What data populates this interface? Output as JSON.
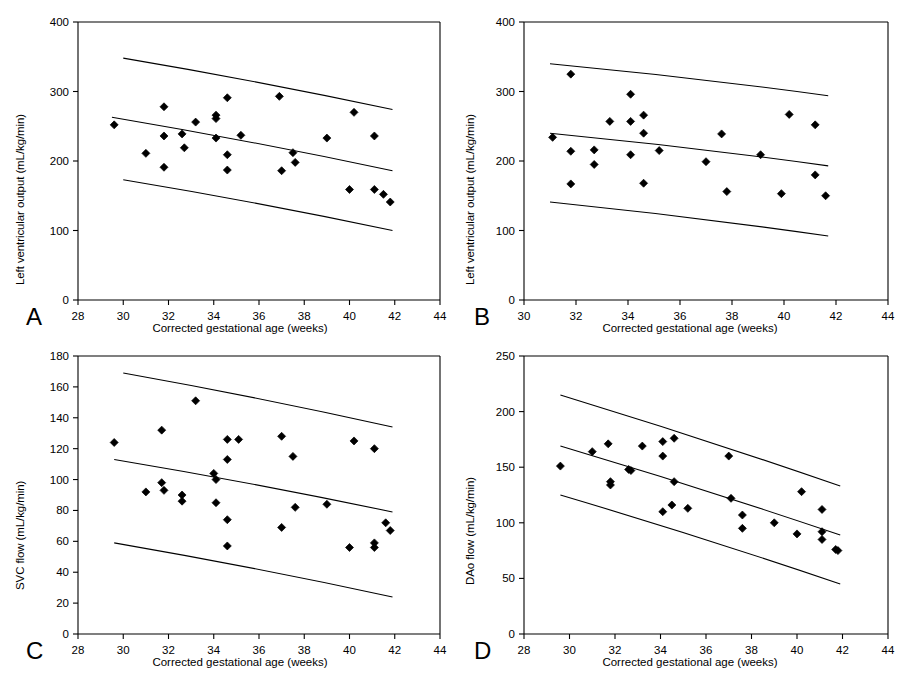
{
  "figure": {
    "title": "",
    "background": "#ffffff",
    "panel_label_color": "#000000",
    "marker_color": "#000000",
    "line_color": "#000000"
  },
  "panels": [
    {
      "id": "A",
      "label": "A",
      "xlabel": "Corrected gestational age (weeks)",
      "ylabel": "Left ventricular output (mL/kg/min)"
    },
    {
      "id": "B",
      "label": "B",
      "xlabel": "Corrected gestational age (weeks)",
      "ylabel": "Left ventricular output (mL/kg/min)"
    },
    {
      "id": "C",
      "label": "C",
      "xlabel": "Corrected gestational age (weeks)",
      "ylabel": "SVC flow (mL/kg/min)"
    },
    {
      "id": "D",
      "label": "D",
      "xlabel": "Corrected gestational age (weeks)",
      "ylabel": "DAo flow (mL/kg/min)"
    }
  ],
  "chart_data": [
    {
      "panel": "A",
      "type": "scatter",
      "title": "",
      "xlabel": "Corrected gestational age (weeks)",
      "ylabel": "Left ventricular output (mL/kg/min)",
      "xlim": [
        28,
        44
      ],
      "ylim": [
        0,
        400
      ],
      "xticks": [
        28,
        30,
        32,
        34,
        36,
        38,
        40,
        42,
        44
      ],
      "yticks": [
        0,
        100,
        200,
        300,
        400
      ],
      "grid": false,
      "legend": "none",
      "points": [
        {
          "x": 29.6,
          "y": 252
        },
        {
          "x": 31.0,
          "y": 211
        },
        {
          "x": 31.8,
          "y": 278
        },
        {
          "x": 31.8,
          "y": 236
        },
        {
          "x": 31.8,
          "y": 191
        },
        {
          "x": 32.6,
          "y": 239
        },
        {
          "x": 32.7,
          "y": 219
        },
        {
          "x": 33.2,
          "y": 256
        },
        {
          "x": 34.1,
          "y": 266
        },
        {
          "x": 34.1,
          "y": 261
        },
        {
          "x": 34.1,
          "y": 233
        },
        {
          "x": 34.6,
          "y": 291
        },
        {
          "x": 34.6,
          "y": 209
        },
        {
          "x": 34.6,
          "y": 187
        },
        {
          "x": 35.2,
          "y": 237
        },
        {
          "x": 36.9,
          "y": 293
        },
        {
          "x": 37.0,
          "y": 186
        },
        {
          "x": 37.5,
          "y": 212
        },
        {
          "x": 37.6,
          "y": 198
        },
        {
          "x": 39.0,
          "y": 233
        },
        {
          "x": 40.0,
          "y": 159
        },
        {
          "x": 40.2,
          "y": 270
        },
        {
          "x": 41.1,
          "y": 236
        },
        {
          "x": 41.1,
          "y": 159
        },
        {
          "x": 41.5,
          "y": 152
        },
        {
          "x": 41.8,
          "y": 141
        }
      ],
      "reference_lines": [
        {
          "name": "upper-limit",
          "x": [
            30.0,
            41.9
          ],
          "y": [
            348,
            274
          ]
        },
        {
          "name": "mean",
          "x": [
            29.5,
            41.9
          ],
          "y": [
            263,
            186
          ]
        },
        {
          "name": "lower-limit",
          "x": [
            30.0,
            41.9
          ],
          "y": [
            173,
            100
          ]
        }
      ]
    },
    {
      "panel": "B",
      "type": "scatter",
      "title": "",
      "xlabel": "Corrected gestational age (weeks)",
      "ylabel": "Left ventricular output (mL/kg/min)",
      "xlim": [
        30,
        44
      ],
      "ylim": [
        0,
        400
      ],
      "xticks": [
        30,
        32,
        34,
        36,
        38,
        40,
        42,
        44
      ],
      "yticks": [
        0,
        100,
        200,
        300,
        400
      ],
      "grid": false,
      "legend": "none",
      "points": [
        {
          "x": 31.1,
          "y": 234
        },
        {
          "x": 31.8,
          "y": 325
        },
        {
          "x": 31.8,
          "y": 214
        },
        {
          "x": 31.8,
          "y": 167
        },
        {
          "x": 32.7,
          "y": 216
        },
        {
          "x": 32.7,
          "y": 195
        },
        {
          "x": 33.3,
          "y": 257
        },
        {
          "x": 34.1,
          "y": 296
        },
        {
          "x": 34.1,
          "y": 257
        },
        {
          "x": 34.1,
          "y": 209
        },
        {
          "x": 34.6,
          "y": 266
        },
        {
          "x": 34.6,
          "y": 240
        },
        {
          "x": 34.6,
          "y": 168
        },
        {
          "x": 35.2,
          "y": 215
        },
        {
          "x": 37.0,
          "y": 199
        },
        {
          "x": 37.6,
          "y": 239
        },
        {
          "x": 37.8,
          "y": 156
        },
        {
          "x": 39.1,
          "y": 209
        },
        {
          "x": 39.9,
          "y": 153
        },
        {
          "x": 40.2,
          "y": 267
        },
        {
          "x": 41.2,
          "y": 252
        },
        {
          "x": 41.2,
          "y": 180
        },
        {
          "x": 41.6,
          "y": 150
        }
      ],
      "reference_lines": [
        {
          "name": "upper-limit",
          "x": [
            31.0,
            41.7
          ],
          "y": [
            340,
            294
          ]
        },
        {
          "name": "mean",
          "x": [
            31.0,
            41.7
          ],
          "y": [
            240,
            193
          ]
        },
        {
          "name": "lower-limit",
          "x": [
            31.0,
            41.7
          ],
          "y": [
            141,
            92
          ]
        }
      ]
    },
    {
      "panel": "C",
      "type": "scatter",
      "title": "",
      "xlabel": "Corrected gestational age (weeks)",
      "ylabel": "SVC flow (mL/kg/min)",
      "xlim": [
        28,
        44
      ],
      "ylim": [
        0,
        180
      ],
      "xticks": [
        28,
        30,
        32,
        34,
        36,
        38,
        40,
        42,
        44
      ],
      "yticks": [
        0,
        20,
        40,
        60,
        80,
        100,
        120,
        140,
        160,
        180
      ],
      "grid": false,
      "legend": "none",
      "points": [
        {
          "x": 29.6,
          "y": 124
        },
        {
          "x": 31.0,
          "y": 92
        },
        {
          "x": 31.7,
          "y": 132
        },
        {
          "x": 31.7,
          "y": 98
        },
        {
          "x": 31.8,
          "y": 93
        },
        {
          "x": 32.6,
          "y": 90
        },
        {
          "x": 32.6,
          "y": 86
        },
        {
          "x": 33.2,
          "y": 151
        },
        {
          "x": 34.0,
          "y": 104
        },
        {
          "x": 34.1,
          "y": 85
        },
        {
          "x": 34.1,
          "y": 100
        },
        {
          "x": 34.6,
          "y": 126
        },
        {
          "x": 34.6,
          "y": 113
        },
        {
          "x": 34.6,
          "y": 74
        },
        {
          "x": 34.6,
          "y": 57
        },
        {
          "x": 35.1,
          "y": 126
        },
        {
          "x": 37.0,
          "y": 128
        },
        {
          "x": 37.0,
          "y": 69
        },
        {
          "x": 37.5,
          "y": 115
        },
        {
          "x": 37.6,
          "y": 82
        },
        {
          "x": 39.0,
          "y": 84
        },
        {
          "x": 40.0,
          "y": 56
        },
        {
          "x": 40.2,
          "y": 125
        },
        {
          "x": 41.1,
          "y": 120
        },
        {
          "x": 41.1,
          "y": 59
        },
        {
          "x": 41.1,
          "y": 56
        },
        {
          "x": 41.6,
          "y": 72
        },
        {
          "x": 41.8,
          "y": 67
        }
      ],
      "reference_lines": [
        {
          "name": "upper-limit",
          "x": [
            30.0,
            41.9
          ],
          "y": [
            169,
            134
          ]
        },
        {
          "name": "mean",
          "x": [
            29.6,
            41.9
          ],
          "y": [
            113,
            79
          ]
        },
        {
          "name": "lower-limit",
          "x": [
            29.6,
            41.9
          ],
          "y": [
            59,
            24
          ]
        }
      ]
    },
    {
      "panel": "D",
      "type": "scatter",
      "title": "",
      "xlabel": "Corrected gestational age (weeks)",
      "ylabel": "DAo flow (mL/kg/min)",
      "xlim": [
        28,
        44
      ],
      "ylim": [
        0,
        250
      ],
      "xticks": [
        28,
        30,
        32,
        34,
        36,
        38,
        40,
        42,
        44
      ],
      "yticks": [
        0,
        50,
        100,
        150,
        200,
        250
      ],
      "grid": false,
      "legend": "none",
      "points": [
        {
          "x": 29.6,
          "y": 151
        },
        {
          "x": 31.0,
          "y": 164
        },
        {
          "x": 31.7,
          "y": 171
        },
        {
          "x": 31.8,
          "y": 137
        },
        {
          "x": 31.8,
          "y": 134
        },
        {
          "x": 32.6,
          "y": 148
        },
        {
          "x": 32.7,
          "y": 147
        },
        {
          "x": 33.2,
          "y": 169
        },
        {
          "x": 34.1,
          "y": 173
        },
        {
          "x": 34.1,
          "y": 160
        },
        {
          "x": 34.1,
          "y": 110
        },
        {
          "x": 34.5,
          "y": 116
        },
        {
          "x": 34.6,
          "y": 176
        },
        {
          "x": 34.6,
          "y": 137
        },
        {
          "x": 35.2,
          "y": 113
        },
        {
          "x": 37.0,
          "y": 160
        },
        {
          "x": 37.1,
          "y": 122
        },
        {
          "x": 37.6,
          "y": 107
        },
        {
          "x": 37.6,
          "y": 95
        },
        {
          "x": 39.0,
          "y": 100
        },
        {
          "x": 40.0,
          "y": 90
        },
        {
          "x": 40.2,
          "y": 128
        },
        {
          "x": 41.1,
          "y": 112
        },
        {
          "x": 41.1,
          "y": 92
        },
        {
          "x": 41.1,
          "y": 85
        },
        {
          "x": 41.7,
          "y": 76
        },
        {
          "x": 41.8,
          "y": 75
        }
      ],
      "reference_lines": [
        {
          "name": "upper-limit",
          "x": [
            29.6,
            41.9
          ],
          "y": [
            215,
            133
          ]
        },
        {
          "name": "mean",
          "x": [
            29.6,
            41.9
          ],
          "y": [
            169,
            89
          ]
        },
        {
          "name": "lower-limit",
          "x": [
            29.6,
            41.9
          ],
          "y": [
            125,
            45
          ]
        }
      ]
    }
  ]
}
